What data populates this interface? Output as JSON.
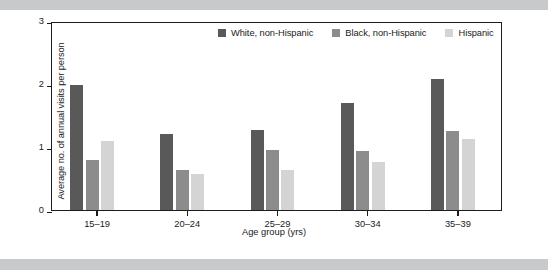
{
  "chart_data": {
    "type": "bar",
    "title": "",
    "subtitle": "",
    "xlabel": "Age group (yrs)",
    "ylabel": "Average no. of annual visits per person",
    "categories": [
      "15–19",
      "20–24",
      "25–29",
      "30–34",
      "35–39"
    ],
    "series": [
      {
        "name": "White, non-Hispanic",
        "color": "#595959",
        "values": [
          1.99,
          1.2,
          1.27,
          1.7,
          2.08
        ]
      },
      {
        "name": "Black, non-Hispanic",
        "color": "#8c8c8c",
        "values": [
          0.8,
          0.64,
          0.95,
          0.94,
          1.25
        ]
      },
      {
        "name": "Hispanic",
        "color": "#d4d4d4",
        "values": [
          1.09,
          0.57,
          0.63,
          0.77,
          1.12
        ]
      }
    ],
    "ylim": [
      0,
      3
    ],
    "yticks": [
      0,
      1,
      2,
      3
    ],
    "ytick_labels": [
      "0",
      "1",
      "2",
      "3"
    ],
    "grid": false,
    "legend_position": "top-right-inside",
    "frame": true
  },
  "colors": {
    "band": "#c8c9ca",
    "axis": "#1c1c1c",
    "text": "#1a1a1a",
    "plot_background": "#ffffff"
  }
}
